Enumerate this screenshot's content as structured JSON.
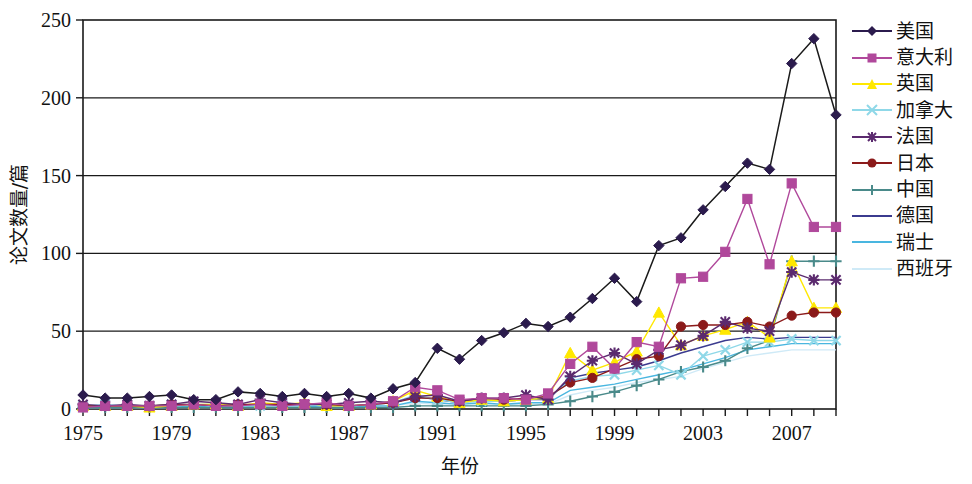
{
  "chart_data": {
    "type": "line",
    "title": "",
    "xlabel": "年份",
    "ylabel": "论文数量/篇",
    "xlim": [
      1975,
      2009
    ],
    "ylim": [
      0,
      250
    ],
    "yticks": [
      0,
      50,
      100,
      150,
      200,
      250
    ],
    "xticks_labeled": [
      1975,
      1979,
      1983,
      1987,
      1991,
      1995,
      1999,
      2003,
      2007
    ],
    "x": [
      1975,
      1976,
      1977,
      1978,
      1979,
      1980,
      1981,
      1982,
      1983,
      1984,
      1985,
      1986,
      1987,
      1988,
      1989,
      1990,
      1991,
      1992,
      1993,
      1994,
      1995,
      1996,
      1997,
      1998,
      1999,
      2000,
      2001,
      2002,
      2003,
      2004,
      2005,
      2006,
      2007,
      2008,
      2009
    ],
    "grid": "horizontal",
    "legend_position": "right",
    "series": [
      {
        "name": "美国",
        "color": "#2b1b4d",
        "marker": "diamond",
        "values": [
          9,
          7,
          7,
          8,
          9,
          6,
          6,
          11,
          10,
          8,
          10,
          8,
          10,
          7,
          13,
          17,
          39,
          32,
          44,
          49,
          55,
          53,
          59,
          71,
          84,
          69,
          105,
          110,
          128,
          143,
          158,
          154,
          222,
          238,
          189
        ]
      },
      {
        "name": "意大利",
        "color": "#b0489b",
        "marker": "square",
        "values": [
          1,
          2,
          2,
          2,
          2,
          3,
          2,
          2,
          3,
          2,
          3,
          4,
          2,
          3,
          5,
          14,
          12,
          6,
          7,
          7,
          6,
          10,
          29,
          40,
          26,
          43,
          40,
          84,
          85,
          101,
          135,
          93,
          145,
          117,
          117
        ]
      },
      {
        "name": "英国",
        "color": "#ffe800",
        "marker": "triangle",
        "values": [
          2,
          2,
          2,
          1,
          2,
          3,
          3,
          2,
          4,
          3,
          4,
          2,
          2,
          3,
          5,
          12,
          8,
          4,
          6,
          5,
          6,
          7,
          36,
          25,
          30,
          37,
          62,
          41,
          47,
          51,
          56,
          46,
          95,
          65,
          65
        ]
      },
      {
        "name": "加拿大",
        "color": "#8fd8e8",
        "marker": "cross",
        "values": [
          2,
          3,
          2,
          2,
          3,
          3,
          3,
          2,
          2,
          3,
          3,
          2,
          2,
          3,
          4,
          9,
          6,
          4,
          5,
          5,
          6,
          7,
          18,
          21,
          22,
          25,
          28,
          22,
          34,
          38,
          43,
          43,
          45,
          44,
          44
        ]
      },
      {
        "name": "法国",
        "color": "#5b2a6e",
        "marker": "asterisk",
        "values": [
          3,
          2,
          3,
          2,
          3,
          5,
          4,
          3,
          6,
          4,
          3,
          3,
          4,
          5,
          4,
          8,
          9,
          5,
          7,
          7,
          9,
          6,
          21,
          31,
          36,
          29,
          38,
          41,
          47,
          56,
          52,
          50,
          88,
          83,
          83
        ]
      },
      {
        "name": "日本",
        "color": "#8b1a1a",
        "marker": "circle",
        "values": [
          2,
          2,
          2,
          2,
          3,
          3,
          2,
          3,
          3,
          3,
          3,
          3,
          2,
          3,
          4,
          7,
          7,
          5,
          7,
          6,
          7,
          8,
          17,
          20,
          26,
          32,
          34,
          53,
          54,
          54,
          56,
          53,
          60,
          62,
          62
        ]
      },
      {
        "name": "中国",
        "color": "#4a8a8a",
        "marker": "plus",
        "values": [
          1,
          1,
          1,
          1,
          1,
          1,
          1,
          1,
          1,
          1,
          1,
          1,
          1,
          1,
          1,
          2,
          2,
          2,
          2,
          2,
          2,
          3,
          5,
          8,
          11,
          15,
          19,
          24,
          27,
          31,
          39,
          44,
          95,
          95,
          95
        ]
      },
      {
        "name": "德国",
        "color": "#3b3b8f",
        "marker": "line",
        "values": [
          2,
          2,
          2,
          2,
          2,
          3,
          2,
          2,
          3,
          3,
          3,
          2,
          2,
          3,
          4,
          8,
          6,
          4,
          6,
          5,
          6,
          6,
          20,
          23,
          25,
          27,
          31,
          36,
          40,
          44,
          46,
          45,
          46,
          46,
          46
        ]
      },
      {
        "name": "瑞士",
        "color": "#49b6e0",
        "marker": "line",
        "values": [
          1,
          1,
          1,
          1,
          1,
          2,
          1,
          1,
          2,
          2,
          2,
          1,
          1,
          2,
          2,
          5,
          4,
          3,
          4,
          3,
          4,
          4,
          12,
          14,
          16,
          19,
          22,
          25,
          29,
          33,
          38,
          40,
          42,
          42,
          42
        ]
      },
      {
        "name": "西班牙",
        "color": "#cfeaf7",
        "marker": "line",
        "values": [
          1,
          1,
          1,
          1,
          1,
          1,
          1,
          1,
          1,
          1,
          1,
          1,
          1,
          1,
          2,
          4,
          3,
          2,
          3,
          3,
          3,
          3,
          9,
          12,
          14,
          17,
          19,
          21,
          26,
          30,
          34,
          36,
          38,
          38,
          38
        ]
      }
    ]
  }
}
